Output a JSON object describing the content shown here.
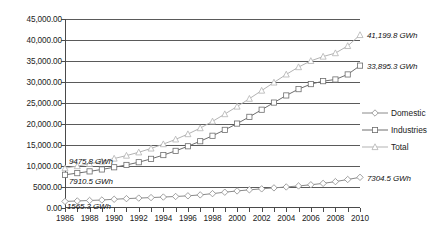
{
  "chart_data": {
    "type": "line",
    "title": "",
    "xlabel": "",
    "ylabel": "",
    "xlim": [
      1986,
      2010
    ],
    "ylim": [
      0,
      45000
    ],
    "grid": true,
    "legend_position": "right",
    "x": [
      1986,
      1987,
      1988,
      1989,
      1990,
      1991,
      1992,
      1993,
      1994,
      1995,
      1996,
      1997,
      1998,
      1999,
      2000,
      2001,
      2002,
      2003,
      2004,
      2005,
      2006,
      2007,
      2008,
      2009,
      2010
    ],
    "y_ticks": [
      0,
      5000,
      10000,
      15000,
      20000,
      25000,
      30000,
      35000,
      40000,
      45000
    ],
    "y_tick_labels": [
      "0.00",
      "5000.00",
      "10,000.00",
      "15,000.00",
      "20,000.00",
      "25,000.00",
      "30,000.00",
      "35,000.00",
      "40,000.00",
      "45,000.00"
    ],
    "x_tick_labels": [
      "1986",
      "1988",
      "1990",
      "1992",
      "1994",
      "1996",
      "1998",
      "2000",
      "2002",
      "2004",
      "2006",
      "2008",
      "2010"
    ],
    "series": [
      {
        "name": "Domestic",
        "marker": "diamond",
        "color": "#8a8a8a",
        "values": [
          1565.3,
          1680,
          1790,
          1905,
          2080,
          2230,
          2360,
          2480,
          2610,
          2740,
          2900,
          3120,
          3420,
          3760,
          4060,
          4330,
          4560,
          4790,
          5010,
          5250,
          5530,
          5860,
          6280,
          6790,
          7304.5
        ]
      },
      {
        "name": "Industries",
        "marker": "square",
        "color": "#6e6e6e",
        "values": [
          7910.5,
          8300,
          8720,
          9180,
          9700,
          10250,
          10900,
          11700,
          12600,
          13600,
          14700,
          15900,
          17200,
          18600,
          20100,
          21700,
          23400,
          25100,
          26800,
          28300,
          29500,
          30200,
          30600,
          31800,
          33895.3
        ]
      },
      {
        "name": "Total",
        "marker": "triangle",
        "color": "#b3b3b3",
        "values": [
          9475.8,
          9980,
          10510,
          11085,
          11780,
          12480,
          13260,
          14180,
          15210,
          16340,
          17600,
          19020,
          20620,
          22360,
          24160,
          26030,
          27960,
          29890,
          31810,
          33550,
          35030,
          36060,
          36880,
          38590,
          41199.8
        ]
      }
    ],
    "annotations": [
      {
        "text": "9475.8 GWh",
        "series": "Total",
        "at": "start"
      },
      {
        "text": "7910.5 GWh",
        "series": "Industries",
        "at": "start"
      },
      {
        "text": "1565.3 GWh",
        "series": "Domestic",
        "at": "start"
      },
      {
        "text": "41,199.8 GWh",
        "series": "Total",
        "at": "end"
      },
      {
        "text": "33,895.3 GWh",
        "series": "Industries",
        "at": "end"
      },
      {
        "text": "7304.5 GWh",
        "series": "Domestic",
        "at": "end"
      }
    ]
  }
}
